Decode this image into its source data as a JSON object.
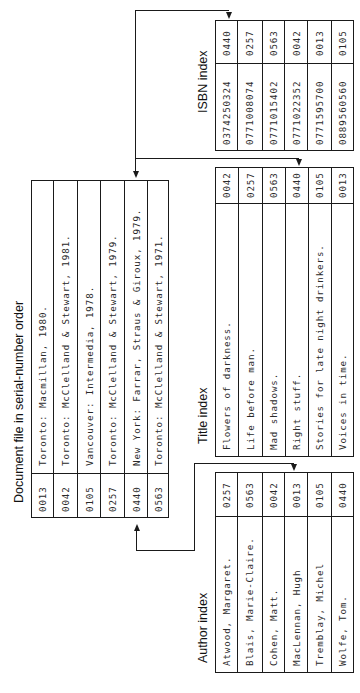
{
  "document_file": {
    "title": "Document file in serial-number order",
    "rows": [
      {
        "serial": "0013",
        "text": "Toronto: Macmillan, 1980."
      },
      {
        "serial": "0042",
        "text": "Toronto: McClelland & Stewart, 1981."
      },
      {
        "serial": "0105",
        "text": "Vancouver: Intermedia, 1978."
      },
      {
        "serial": "0257",
        "text": "Toronto: McClelland & Stewart, 1979."
      },
      {
        "serial": "0440",
        "text": "New York: Farrar, Straus & Giroux, 1979."
      },
      {
        "serial": "0563",
        "text": "Toronto: McClelland & Stewart, 1971."
      }
    ]
  },
  "isbn_index": {
    "title": "ISBN index",
    "rows": [
      {
        "isbn": "0374250324",
        "serial": "0440"
      },
      {
        "isbn": "0771008074",
        "serial": "0257"
      },
      {
        "isbn": "0771015402",
        "serial": "0563"
      },
      {
        "isbn": "0771022352",
        "serial": "0042"
      },
      {
        "isbn": "0771595700",
        "serial": "0013"
      },
      {
        "isbn": "0889560560",
        "serial": "0105"
      }
    ]
  },
  "title_index": {
    "title": "Title index",
    "rows": [
      {
        "title": "Flowers of darkness.",
        "serial": "0042"
      },
      {
        "title": "Life before man.",
        "serial": "0257"
      },
      {
        "title": "Mad shadows.",
        "serial": "0563"
      },
      {
        "title": "Right stuff.",
        "serial": "0440"
      },
      {
        "title": "Stories for late night drinkers.",
        "serial": "0105"
      },
      {
        "title": "Voices in time.",
        "serial": "0013"
      }
    ]
  },
  "author_index": {
    "title": "Author index",
    "rows": [
      {
        "author": "Atwood, Margaret.",
        "serial": "0257"
      },
      {
        "author": "Blais, Marie-Claire.",
        "serial": "0563"
      },
      {
        "author": "Cohen, Matt.",
        "serial": "0042"
      },
      {
        "author": "MacLennan, Hugh",
        "serial": "0013"
      },
      {
        "author": "Tremblay, Michel",
        "serial": "0105"
      },
      {
        "author": "Wolfe, Tom.",
        "serial": "0440"
      }
    ]
  },
  "colors": {
    "line": "#1a1a1a",
    "text": "#2a2a2a",
    "background": "#ffffff"
  }
}
